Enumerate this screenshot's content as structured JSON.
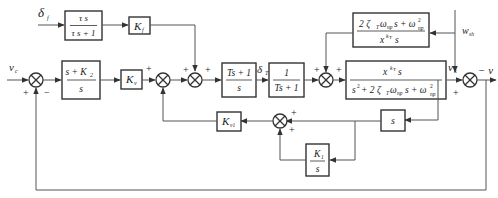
{
  "diagram": {
    "title": "",
    "signals": {
      "delta_f": "δ",
      "delta_f_sub": "f",
      "v_c": "v",
      "v_c_sub": "c",
      "delta_T": "δ",
      "delta_T_sub": "T",
      "v_k": "v",
      "v_k_sub": "k",
      "w_sh": "w",
      "w_sh_sub": "sh",
      "output": "− v"
    },
    "blocks": {
      "washout": {
        "num": "τ s",
        "den": "τ s + 1"
      },
      "kf": {
        "main": "K",
        "sub": "f"
      },
      "pi_k2": {
        "num": "s + K",
        "num_sub": "2",
        "den": "s"
      },
      "kv": {
        "main": "K",
        "sub": "v"
      },
      "lead": {
        "num": "Ts + 1",
        "den": "s"
      },
      "lag": {
        "num": "1",
        "den": "Ts + 1"
      },
      "disturbance": {
        "num": "2 ζ",
        "num_mid": "ω",
        "num_tail": "s + ω",
        "den": "x",
        "den_tail": "s"
      },
      "plant": {
        "num": "x",
        "num_tail": "s",
        "den": "s",
        "den_mid": "+ 2 ζ",
        "den_tail": "s + ω"
      },
      "deriv": {
        "label": "s"
      },
      "kv1": {
        "main": "K",
        "sub": "v1"
      },
      "integ": {
        "num": "K",
        "num_sub": "1",
        "den": "s"
      }
    },
    "summing_junctions": [
      {
        "id": "sj1",
        "signs": [
          "+",
          "−"
        ]
      },
      {
        "id": "sj2",
        "signs": [
          "+"
        ]
      },
      {
        "id": "sj3",
        "signs": [
          "+",
          "+"
        ]
      },
      {
        "id": "sj4",
        "signs": [
          "+",
          "+"
        ]
      },
      {
        "id": "sj5",
        "signs": [
          "+",
          "− "
        ]
      },
      {
        "id": "sj6",
        "signs": [
          "+",
          "+"
        ]
      }
    ]
  }
}
